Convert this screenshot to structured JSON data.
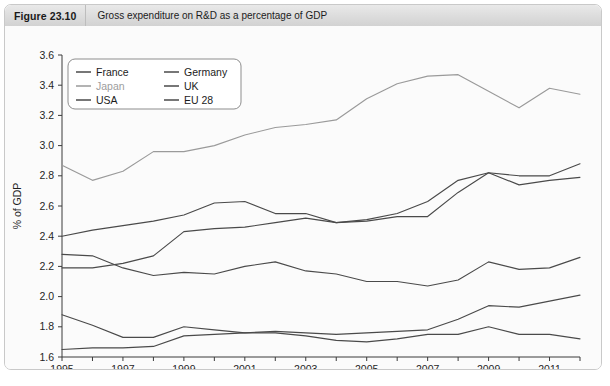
{
  "figure": {
    "number": "Figure 23.10",
    "title": "Gross expenditure on R&D as a percentage of GDP"
  },
  "footnote": "",
  "chart_data": {
    "type": "line",
    "title": "Gross expenditure on R&D as a percentage of GDP",
    "xlabel": "",
    "ylabel": "% of GDP",
    "xlim": [
      1995,
      2012
    ],
    "ylim": [
      1.6,
      3.6
    ],
    "ytick_step": 0.2,
    "yticks": [
      "1.6",
      "1.8",
      "2.0",
      "2.2",
      "2.4",
      "2.6",
      "2.8",
      "3.0",
      "3.2",
      "3.4",
      "3.6"
    ],
    "xticks": [
      "1995",
      "1997",
      "1999",
      "2001",
      "2003",
      "2005",
      "2007",
      "2009",
      "2011"
    ],
    "xtick_step": 2,
    "minor_xticks_step": 1,
    "grid": false,
    "legend_position": "top-left-inside",
    "x": [
      1995,
      1996,
      1997,
      1998,
      1999,
      2000,
      2001,
      2002,
      2003,
      2004,
      2005,
      2006,
      2007,
      2008,
      2009,
      2010,
      2011,
      2012
    ],
    "series": [
      {
        "name": "France",
        "color": "#4a4a4a",
        "values": [
          2.28,
          2.27,
          2.19,
          2.14,
          2.16,
          2.15,
          2.2,
          2.23,
          2.17,
          2.15,
          2.1,
          2.1,
          2.07,
          2.11,
          2.23,
          2.18,
          2.19,
          2.26
        ]
      },
      {
        "name": "Germany",
        "color": "#4a4a4a",
        "values": [
          2.19,
          2.19,
          2.22,
          2.27,
          2.43,
          2.45,
          2.46,
          2.49,
          2.52,
          2.49,
          2.5,
          2.53,
          2.53,
          2.69,
          2.82,
          2.8,
          2.8,
          2.88
        ]
      },
      {
        "name": "Japan",
        "color": "#9a9a9a",
        "values": [
          2.87,
          2.77,
          2.83,
          2.96,
          2.96,
          3.0,
          3.07,
          3.12,
          3.14,
          3.17,
          3.31,
          3.41,
          3.46,
          3.47,
          3.36,
          3.25,
          3.38,
          3.34
        ]
      },
      {
        "name": "UK",
        "color": "#4a4a4a",
        "values": [
          1.88,
          1.81,
          1.73,
          1.73,
          1.8,
          1.78,
          1.76,
          1.76,
          1.74,
          1.71,
          1.7,
          1.72,
          1.75,
          1.75,
          1.8,
          1.75,
          1.75,
          1.72
        ]
      },
      {
        "name": "USA",
        "color": "#4a4a4a",
        "values": [
          2.4,
          2.44,
          2.47,
          2.5,
          2.54,
          2.62,
          2.63,
          2.55,
          2.55,
          2.49,
          2.51,
          2.55,
          2.63,
          2.77,
          2.82,
          2.74,
          2.77,
          2.79
        ]
      },
      {
        "name": "EU 28",
        "color": "#4a4a4a",
        "values": [
          1.65,
          1.66,
          1.66,
          1.67,
          1.74,
          1.75,
          1.76,
          1.77,
          1.76,
          1.75,
          1.76,
          1.77,
          1.78,
          1.85,
          1.94,
          1.93,
          1.97,
          2.01
        ]
      }
    ],
    "legend_layout": [
      [
        "France",
        "Germany"
      ],
      [
        "Japan",
        "UK"
      ],
      [
        "USA",
        "EU 28"
      ]
    ]
  }
}
